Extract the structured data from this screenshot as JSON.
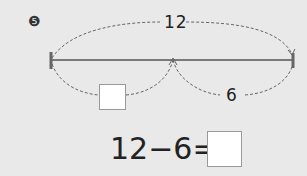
{
  "problem_number": "❺",
  "diagram": {
    "total_label": "12",
    "right_part_label": "6",
    "left_part_label": ""
  },
  "equation": {
    "minuend": "12",
    "operator": "−",
    "subtrahend": "6",
    "equals": "=",
    "answer": ""
  }
}
